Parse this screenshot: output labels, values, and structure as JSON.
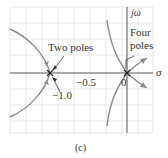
{
  "figure": {
    "type": "root-locus",
    "caption": "(c)",
    "axes": {
      "x_label": "σ",
      "y_label": "jω",
      "tick_labels": [
        "−0.5",
        "−1.0",
        "0"
      ]
    },
    "annotations": {
      "two_poles": "Two poles",
      "four_poles_line1": "Four",
      "four_poles_line2": "poles"
    },
    "colors": {
      "grid": "#e4e4e4",
      "axis": "#555555",
      "locus": "#8a8a8a",
      "text": "#333333"
    },
    "poles": [
      {
        "location": -1.0,
        "multiplicity": 2
      },
      {
        "location": 0.0,
        "multiplicity": 4
      }
    ]
  }
}
